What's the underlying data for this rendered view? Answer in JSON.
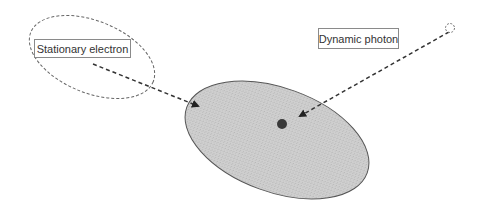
{
  "labels": {
    "stationary_electron": "Stationary electron",
    "dynamic_photon": "Dynamic photon"
  },
  "colors": {
    "ellipse_fill": "#c8c8c8",
    "ellipse_stroke": "#555555",
    "particle": "#3a3a3a",
    "arrow": "#333333",
    "dashed_outline": "#666666"
  }
}
